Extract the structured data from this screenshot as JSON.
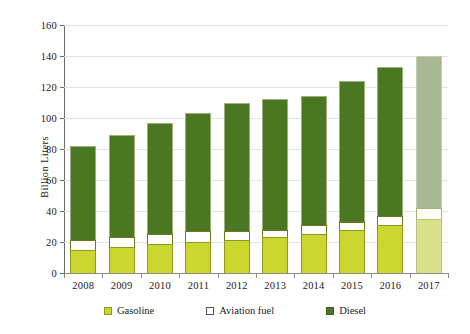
{
  "chart_data": {
    "type": "bar",
    "subtype": "stacked-bar",
    "title": "",
    "xlabel": "",
    "ylabel": "Billion Liters",
    "ylim": [
      0,
      160
    ],
    "ytick_step": 20,
    "yticks": [
      "160",
      "140",
      "120",
      "100",
      "80",
      "60",
      "40",
      "20",
      "0"
    ],
    "grid": true,
    "legend_position": "bottom",
    "categories": [
      "2008",
      "2009",
      "2010",
      "2011",
      "2012",
      "2013",
      "2014",
      "2015",
      "2016",
      "2017"
    ],
    "series": [
      {
        "name": "Gasoline",
        "values": [
          15,
          17,
          19,
          20,
          21,
          23,
          25,
          28,
          31,
          35
        ]
      },
      {
        "name": "Aviation fuel",
        "values": [
          6,
          6,
          6,
          7,
          6,
          5,
          6,
          5,
          6,
          7
        ]
      },
      {
        "name": "Diesel",
        "values": [
          61,
          66,
          72,
          76,
          83,
          84,
          83,
          91,
          96,
          98
        ]
      }
    ],
    "totals": [
      82,
      89,
      97,
      103,
      110,
      112,
      114,
      124,
      133,
      140
    ]
  },
  "legend": {
    "items": [
      {
        "label": "Gasoline",
        "color": "#cbd62e",
        "swatch": "sw-gasoline"
      },
      {
        "label": "Aviation fuel",
        "color": "#ffffff",
        "swatch": "sw-aviation"
      },
      {
        "label": "Diesel",
        "color": "#4b7622",
        "swatch": "sw-diesel"
      }
    ]
  },
  "colors": {
    "gasoline": "#cbd62e",
    "aviation_fuel": "#ffffff",
    "diesel": "#4b7622",
    "forecast_gasoline": "#d8e08a",
    "forecast_diesel": "#a8b894",
    "grid": "#e2e2e2",
    "axis": "#6b6b6b",
    "background": "#ffffff"
  }
}
